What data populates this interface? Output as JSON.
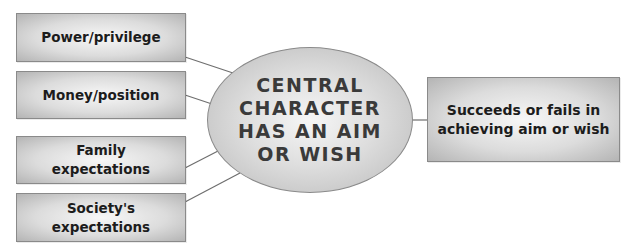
{
  "diagram": {
    "center": {
      "label": "CENTRAL\nCHARACTER\nHAS AN AIM\nOR WISH"
    },
    "influences": [
      {
        "label": "Power/privilege"
      },
      {
        "label": "Money/position"
      },
      {
        "label": "Family\nexpectations"
      },
      {
        "label": "Society's\nexpectations"
      }
    ],
    "outcome": {
      "label": "Succeeds or fails in\nachieving aim or wish"
    },
    "colors": {
      "box_border": "#8a8a8a",
      "box_text": "#1c1c1c",
      "center_text": "#3a3a3a",
      "connector": "#6e6e6e",
      "gradient_light": "#f7f7f7",
      "gradient_dark": "#b4b4b4"
    }
  }
}
